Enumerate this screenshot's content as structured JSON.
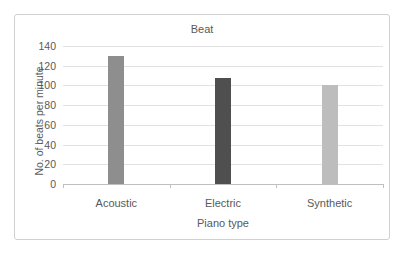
{
  "chart_data": {
    "type": "bar",
    "title": "Beat",
    "categories": [
      "Acoustic",
      "Electric",
      "Synthetic"
    ],
    "values": [
      130,
      108,
      100
    ],
    "bar_colors": [
      "#8e8e8e",
      "#4f4f4f",
      "#bdbdbd"
    ],
    "xlabel": "Piano type",
    "ylabel": "No. of beats per minute",
    "ylim": [
      0,
      140
    ],
    "ytick_step": 20,
    "ytick_labels": [
      "0",
      "20",
      "40",
      "60",
      "80",
      "100",
      "120",
      "140"
    ],
    "grid": true,
    "legend": false,
    "colors": {
      "text": "#595959",
      "gridline": "#e2e2e2",
      "axis_line": "#bfbfbf",
      "frame_border": "#d0d0d0",
      "background": "#ffffff"
    }
  }
}
